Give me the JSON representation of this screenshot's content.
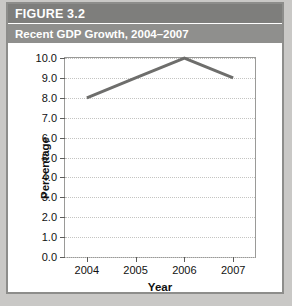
{
  "figure": {
    "number_label": "FIGURE 3.2",
    "caption": "Recent GDP Growth, 2004–2007"
  },
  "chart_data": {
    "type": "line",
    "title": "Recent GDP Growth, 2004–2007",
    "xlabel": "Year",
    "ylabel": "Percentage",
    "categories": [
      "2004",
      "2005",
      "2006",
      "2007"
    ],
    "values": [
      8.0,
      9.0,
      10.0,
      9.0
    ],
    "ylim": [
      0.0,
      10.0
    ],
    "ytick_labels": [
      "0.0",
      "1.0",
      "2.0",
      "3.0",
      "4.0",
      "5.0",
      "6.0",
      "7.0",
      "8.0",
      "9.0",
      "10.0"
    ],
    "ytick_values": [
      0.0,
      1.0,
      2.0,
      3.0,
      4.0,
      5.0,
      6.0,
      7.0,
      8.0,
      9.0,
      10.0
    ],
    "grid": true,
    "legend": null,
    "line_color": "#6e6e6c",
    "grid_color": "#c4c4c2"
  },
  "colors": {
    "header_band": "#7e7e7c",
    "subtitle_band": "#8f8f8d",
    "page_background": "#c9c8c6",
    "figure_border": "#8d8d8b",
    "plot_background": "#ffffff",
    "axis": "#9a9a98"
  }
}
